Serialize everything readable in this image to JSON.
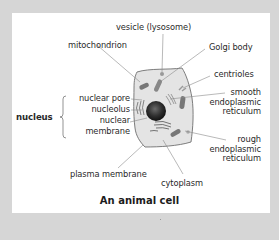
{
  "diagram": {
    "title": "An animal cell",
    "labels": {
      "vesicle": "vesicle (lysosome)",
      "mitochondrion": "mitochondrion",
      "golgi": "Golgi body",
      "centrioles": "centrioles",
      "smooth_er": [
        "smooth",
        "endoplasmic",
        "reticulum"
      ],
      "rough_er": [
        "rough",
        "endoplasmic",
        "reticulum"
      ],
      "nucleus": "nucleus",
      "nuclear_pore": "nuclear pore",
      "nucleolus": "nucleolus",
      "nuclear_membrane": [
        "nuclear",
        "membrane"
      ],
      "plasma_membrane": "plasma membrane",
      "cytoplasm": "cytoplasm"
    },
    "colors": {
      "background": "#d6d6d6",
      "panel": "#ffffff",
      "cell_fill": "#e4e4e4",
      "cell_outline": "#6f6f6f",
      "leader_lines": "#8a8a8a",
      "text": "#2a2a2a"
    }
  }
}
